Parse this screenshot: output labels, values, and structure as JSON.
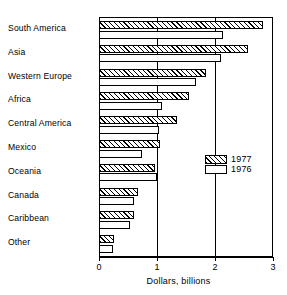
{
  "chart_data": {
    "type": "bar",
    "orientation": "horizontal",
    "title": "",
    "xlabel": "Dollars, billions",
    "ylabel": "",
    "xlim": [
      0,
      3
    ],
    "xticks": [
      0,
      1,
      2,
      3
    ],
    "xtick_labels": [
      "0",
      "1",
      "2",
      "3"
    ],
    "grid": true,
    "grid_axis": "x",
    "legend_position": "inside-right-middle",
    "categories": [
      "South America",
      "Asia",
      "Western Europe",
      "Africa",
      "Central America",
      "Mexico",
      "Oceania",
      "Canada",
      "Caribbean",
      "Other"
    ],
    "series": [
      {
        "name": "1977",
        "fill": "hatched",
        "values": [
          2.83,
          2.57,
          1.84,
          1.55,
          1.34,
          1.05,
          0.96,
          0.67,
          0.6,
          0.26
        ]
      },
      {
        "name": "1976",
        "fill": "white",
        "values": [
          2.14,
          2.1,
          1.67,
          1.08,
          1.03,
          0.74,
          1.0,
          0.6,
          0.53,
          0.24
        ]
      }
    ]
  },
  "axis": {
    "x_title": "Dollars, billions",
    "ticks": [
      "0",
      "1",
      "2",
      "3"
    ]
  },
  "legend": {
    "items": [
      {
        "label": "1977"
      },
      {
        "label": "1976"
      }
    ]
  },
  "colors": {
    "ink": "#000000",
    "paper": "#ffffff"
  }
}
